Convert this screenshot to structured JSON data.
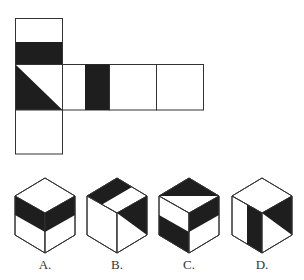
{
  "net": {
    "description": "Unfolded cube net: vertical column of 3 squares on left, with a horizontal row extending right from the middle square",
    "faces": [
      {
        "id": "top",
        "pattern": "lower-half-black-band"
      },
      {
        "id": "middle-left",
        "pattern": "lower-left-black-triangle"
      },
      {
        "id": "bottom",
        "pattern": "blank"
      },
      {
        "id": "row-2",
        "pattern": "vertical-black-stripe-right-half"
      },
      {
        "id": "row-3",
        "pattern": "blank"
      },
      {
        "id": "row-4",
        "pattern": "blank"
      }
    ]
  },
  "options": [
    {
      "label": "A."
    },
    {
      "label": "B."
    },
    {
      "label": "C."
    },
    {
      "label": "D."
    }
  ],
  "colors": {
    "ink": "#222222",
    "fill": "#1e1e1e",
    "background": "#ffffff"
  }
}
